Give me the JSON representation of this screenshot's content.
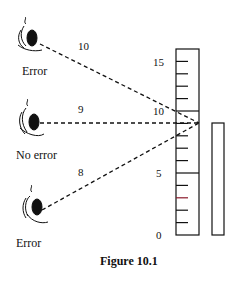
{
  "figure": {
    "caption": "Figure 10.1"
  },
  "eyes": [
    {
      "label": "Error",
      "distance_label": "10",
      "position": "top"
    },
    {
      "label": "No error",
      "distance_label": "9",
      "position": "middle"
    },
    {
      "label": "Error",
      "distance_label": "8",
      "position": "bottom"
    }
  ],
  "ruler": {
    "scale_labels": [
      "15",
      "10",
      "5",
      "0"
    ]
  },
  "colors": {
    "line": "#111111",
    "background": "#ffffff",
    "tick_accent": "#8b1a2b"
  }
}
